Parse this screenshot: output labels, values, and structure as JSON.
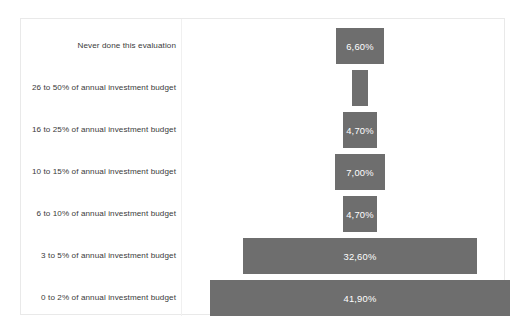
{
  "chart_data": {
    "type": "bar",
    "orientation": "horizontal-centered",
    "title": "",
    "subtitle": "",
    "xlabel": "",
    "ylabel": "",
    "grid": false,
    "legend": "none",
    "bar_color": "#6e6e6e",
    "value_label_color": "#ffffff",
    "value_suffix": "%",
    "decimal_separator": ",",
    "xlim": [
      0,
      45
    ],
    "categories": [
      "Never done this evaluation",
      "26 to 50% of annual investment budget",
      "16 to 25% of annual investment budget",
      "10 to 15% of annual investment budget",
      "6 to 10% of annual investment budget",
      "3 to 5% of annual investment budget",
      "0 to 2% of annual investment budget"
    ],
    "values": [
      6.6,
      2.3,
      4.7,
      7.0,
      4.7,
      32.6,
      41.9
    ],
    "value_labels": [
      "6,60%",
      "",
      "4,70%",
      "7,00%",
      "4,70%",
      "32,60%",
      "41,90%"
    ],
    "bars": [
      {
        "category": "Never done this evaluation",
        "value": 6.6,
        "label": "6,60%",
        "label_visible": true
      },
      {
        "category": "26 to 50% of annual investment budget",
        "value": 2.3,
        "label": "",
        "label_visible": false
      },
      {
        "category": "16 to 25% of annual investment budget",
        "value": 4.7,
        "label": "4,70%",
        "label_visible": true
      },
      {
        "category": "10 to 15% of annual investment budget",
        "value": 7.0,
        "label": "7,00%",
        "label_visible": true
      },
      {
        "category": "6 to 10% of annual investment budget",
        "value": 4.7,
        "label": "4,70%",
        "label_visible": true
      },
      {
        "category": "3 to 5% of annual investment budget",
        "value": 32.6,
        "label": "32,60%",
        "label_visible": true
      },
      {
        "category": "0 to 2% of annual investment budget",
        "value": 41.9,
        "label": "41,90%",
        "label_visible": true
      }
    ]
  }
}
